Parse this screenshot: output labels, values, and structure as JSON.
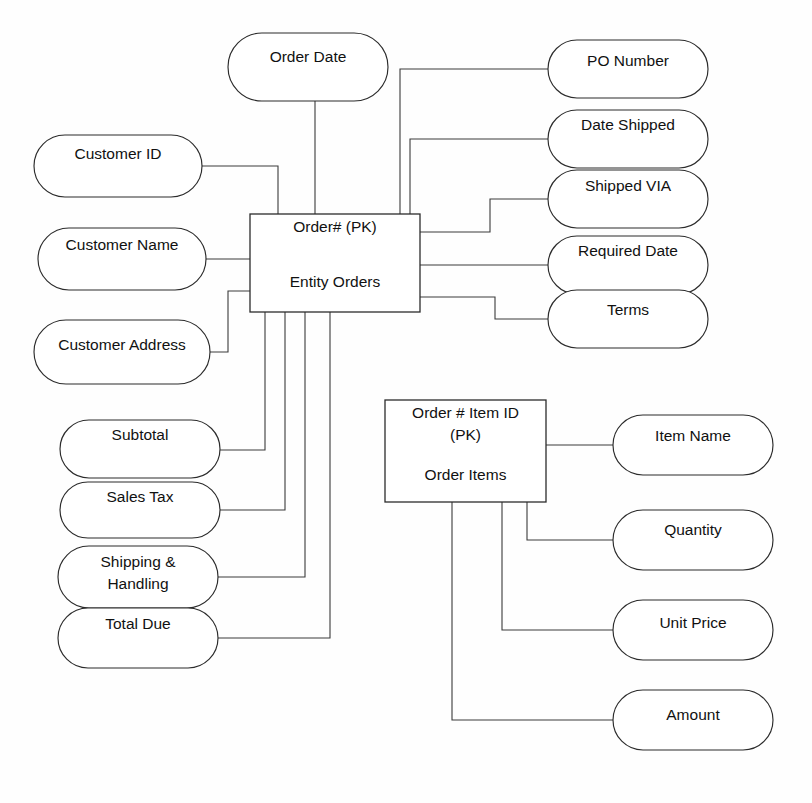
{
  "diagram": {
    "kind": "entity-relationship-diagram",
    "background_color": "#fefefe",
    "line_color": "#3a3a3a",
    "shape_fill": "#ffffff",
    "shape_stroke": "#2b2b2b",
    "text_color": "#111111"
  },
  "entities": [
    {
      "id": "entity-orders",
      "key_label": "Order# (PK)",
      "name_label": "Entity Orders",
      "x": 250,
      "y": 214,
      "width": 170,
      "height": 98,
      "key_text_y": 228,
      "name_text_y": 283
    },
    {
      "id": "entity-order-items",
      "key_line_1": "Order # Item ID",
      "key_line_2": "(PK)",
      "name_label": "Order Items",
      "x": 385,
      "y": 400,
      "width": 161,
      "height": 102,
      "key_text_y": 414,
      "key_text_y2": 436,
      "name_text_y": 476
    }
  ],
  "attributes": [
    {
      "id": "attr-order-date",
      "label": "Order Date",
      "x": 228,
      "y": 33,
      "width": 160,
      "height": 68,
      "text_y": 58,
      "lines": 1
    },
    {
      "id": "attr-customer-id",
      "label": "Customer ID",
      "x": 34,
      "y": 135,
      "width": 168,
      "height": 62,
      "text_y": 155,
      "lines": 1
    },
    {
      "id": "attr-customer-name",
      "label": "Customer Name",
      "x": 38,
      "y": 228,
      "width": 168,
      "height": 62,
      "text_y": 246,
      "lines": 1
    },
    {
      "id": "attr-customer-address",
      "label": "Customer Address",
      "x": 34,
      "y": 320,
      "width": 176,
      "height": 64,
      "text_y": 346,
      "lines": 1
    },
    {
      "id": "attr-subtotal",
      "label": "Subtotal",
      "x": 60,
      "y": 420,
      "width": 160,
      "height": 58,
      "text_y": 436,
      "lines": 1
    },
    {
      "id": "attr-sales-tax",
      "label": "Sales Tax",
      "x": 60,
      "y": 482,
      "width": 160,
      "height": 56,
      "text_y": 498,
      "lines": 1
    },
    {
      "id": "attr-shipping-handling",
      "label": "Shipping & Handling",
      "line_1": "Shipping &",
      "line_2": "Handling",
      "x": 58,
      "y": 546,
      "width": 160,
      "height": 62,
      "text_y": 563,
      "lines": 2
    },
    {
      "id": "attr-total-due",
      "label": "Total Due",
      "x": 58,
      "y": 608,
      "width": 160,
      "height": 60,
      "text_y": 625,
      "lines": 1
    },
    {
      "id": "attr-po-number",
      "label": "PO Number",
      "x": 548,
      "y": 40,
      "width": 160,
      "height": 58,
      "text_y": 62,
      "lines": 1
    },
    {
      "id": "attr-date-shipped",
      "label": "Date Shipped",
      "x": 548,
      "y": 110,
      "width": 160,
      "height": 58,
      "text_y": 126,
      "lines": 1
    },
    {
      "id": "attr-shipped-via",
      "label": "Shipped VIA",
      "x": 548,
      "y": 170,
      "width": 160,
      "height": 58,
      "text_y": 187,
      "lines": 1
    },
    {
      "id": "attr-required-date",
      "label": "Required Date",
      "x": 548,
      "y": 236,
      "width": 160,
      "height": 58,
      "text_y": 252,
      "lines": 1
    },
    {
      "id": "attr-terms",
      "label": "Terms",
      "x": 548,
      "y": 290,
      "width": 160,
      "height": 58,
      "text_y": 311,
      "lines": 1
    },
    {
      "id": "attr-item-name",
      "label": "Item Name",
      "x": 613,
      "y": 415,
      "width": 160,
      "height": 60,
      "text_y": 437,
      "lines": 1
    },
    {
      "id": "attr-quantity",
      "label": "Quantity",
      "x": 613,
      "y": 510,
      "width": 160,
      "height": 60,
      "text_y": 531,
      "lines": 1
    },
    {
      "id": "attr-unit-price",
      "label": "Unit Price",
      "x": 613,
      "y": 600,
      "width": 160,
      "height": 60,
      "text_y": 624,
      "lines": 1
    },
    {
      "id": "attr-amount",
      "label": "Amount",
      "x": 613,
      "y": 690,
      "width": 160,
      "height": 60,
      "text_y": 716,
      "lines": 1
    }
  ],
  "connectors": [
    {
      "id": "conn-order-date",
      "from": "attr-order-date",
      "to": "entity-orders",
      "path": "M 315 101 L 315 214"
    },
    {
      "id": "conn-customer-id",
      "from": "attr-customer-id",
      "to": "entity-orders",
      "path": "M 202 166 L 278 166 L 278 214"
    },
    {
      "id": "conn-customer-name",
      "from": "attr-customer-name",
      "to": "entity-orders",
      "path": "M 206 259 L 250 259"
    },
    {
      "id": "conn-customer-address",
      "from": "attr-customer-address",
      "to": "entity-orders",
      "path": "M 210 352 L 228 352 L 228 291 L 250 291"
    },
    {
      "id": "conn-po-number",
      "from": "entity-orders",
      "to": "attr-po-number",
      "path": "M 400 214 L 400 69 L 548 69"
    },
    {
      "id": "conn-date-shipped",
      "from": "entity-orders",
      "to": "attr-date-shipped",
      "path": "M 410 214 L 410 139 L 548 139"
    },
    {
      "id": "conn-shipped-via",
      "from": "entity-orders",
      "to": "attr-shipped-via",
      "path": "M 420 232 L 490 232 L 490 199 L 548 199"
    },
    {
      "id": "conn-required-date",
      "from": "entity-orders",
      "to": "attr-required-date",
      "path": "M 420 265 L 548 265"
    },
    {
      "id": "conn-terms",
      "from": "entity-orders",
      "to": "attr-terms",
      "path": "M 420 297 L 495 297 L 495 319 L 548 319"
    },
    {
      "id": "conn-subtotal",
      "from": "attr-subtotal",
      "to": "entity-orders",
      "path": "M 220 450 L 265 450 L 265 312"
    },
    {
      "id": "conn-sales-tax",
      "from": "attr-sales-tax",
      "to": "entity-orders",
      "path": "M 220 510 L 285 510 L 285 312"
    },
    {
      "id": "conn-shipping-handling",
      "from": "attr-shipping-handling",
      "to": "entity-orders",
      "path": "M 218 577 L 305 577 L 305 312"
    },
    {
      "id": "conn-total-due",
      "from": "attr-total-due",
      "to": "entity-orders",
      "path": "M 218 638 L 330 638 L 330 312"
    },
    {
      "id": "conn-item-name",
      "from": "entity-order-items",
      "to": "attr-item-name",
      "path": "M 546 445 L 613 445"
    },
    {
      "id": "conn-quantity",
      "from": "entity-order-items",
      "to": "attr-quantity",
      "path": "M 527 502 L 527 540 L 613 540"
    },
    {
      "id": "conn-unit-price",
      "from": "entity-order-items",
      "to": "attr-unit-price",
      "path": "M 502 502 L 502 630 L 613 630"
    },
    {
      "id": "conn-amount",
      "from": "entity-order-items",
      "to": "attr-amount",
      "path": "M 452 502 L 452 720 L 613 720"
    }
  ]
}
